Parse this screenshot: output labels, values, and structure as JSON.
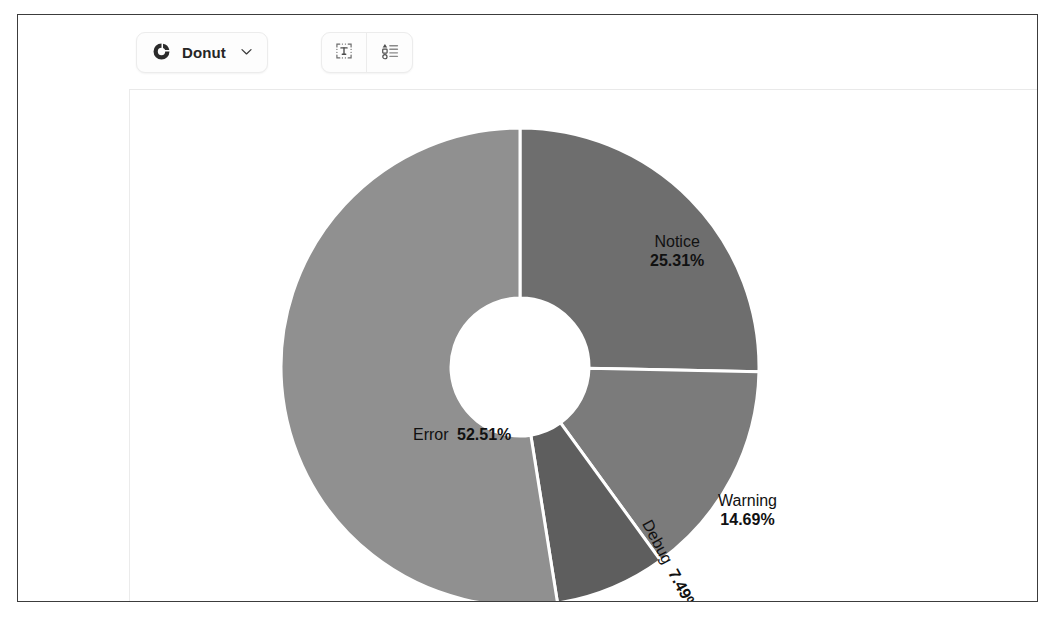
{
  "toolbar": {
    "chart_type": {
      "icon": "donut-chart-icon",
      "label": "Donut",
      "chevron": "chevron-down-icon"
    },
    "buttons": [
      {
        "icon": "text-labels-icon",
        "name": "toggle-data-labels"
      },
      {
        "icon": "legend-list-icon",
        "name": "toggle-legend"
      }
    ]
  },
  "chart_data": {
    "type": "pie",
    "variant": "donut",
    "title": "",
    "start_angle_deg": 0,
    "direction": "clockwise",
    "inner_radius_ratio": 0.29,
    "label_format": "name + percent",
    "legend": "hidden",
    "grid": false,
    "categories": [
      "Notice",
      "Warning",
      "Debug",
      "Error"
    ],
    "values": [
      25.31,
      14.69,
      7.49,
      52.51
    ],
    "unit": "%",
    "slices": [
      {
        "name": "Notice",
        "value": 25.31,
        "percent_text": "25.31%",
        "color": "#6e6e6e",
        "start_deg": 0,
        "end_deg": 91.116,
        "label_layout": "stacked"
      },
      {
        "name": "Warning",
        "value": 14.69,
        "percent_text": "14.69%",
        "color": "#7b7b7b",
        "start_deg": 91.116,
        "end_deg": 144.0,
        "label_layout": "stacked"
      },
      {
        "name": "Debug",
        "value": 7.49,
        "percent_text": "7.49%",
        "color": "#5e5e5e",
        "start_deg": 144.0,
        "end_deg": 170.964,
        "label_layout": "rotated"
      },
      {
        "name": "Error",
        "value": 52.51,
        "percent_text": "52.51%",
        "color": "#909090",
        "start_deg": 170.964,
        "end_deg": 360.0,
        "label_layout": "inline"
      }
    ],
    "geometry": {
      "center_x": 390,
      "center_y": 277,
      "outer_radius": 239,
      "inner_radius": 69,
      "separator_color": "#ffffff",
      "separator_width": 3
    }
  }
}
